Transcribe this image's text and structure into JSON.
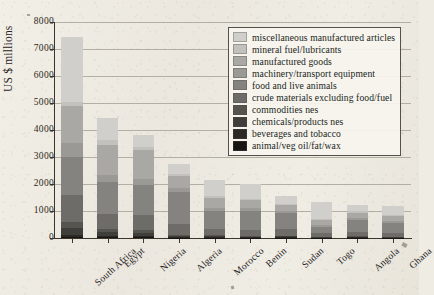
{
  "chart_data": {
    "type": "bar",
    "stacked": true,
    "title": "",
    "subtitle": "",
    "xlabel": "",
    "ylabel": "US $ millions",
    "ylim": [
      0,
      8000
    ],
    "ytick_values": [
      0,
      1000,
      2000,
      3000,
      4000,
      5000,
      6000,
      7000,
      8000
    ],
    "ytick_labels": [
      "0",
      "1000",
      "2000",
      "3000",
      "4000",
      "5000",
      "6000",
      "7000",
      "8000"
    ],
    "grid": true,
    "legend_position": "upper-right-inside",
    "categories": [
      "South Africa",
      "Egypt",
      "Nigeria",
      "Algeria",
      "Morocco",
      "Benin",
      "Sudan",
      "Togo",
      "Angola",
      "Ghana"
    ],
    "totals": [
      7430,
      4450,
      3800,
      2750,
      2150,
      2020,
      1550,
      1330,
      1240,
      1180
    ],
    "series": [
      {
        "name": "miscellaneous manufactured articles",
        "color": "#d0cfcb",
        "values": [
          2380,
          820,
          420,
          360,
          610,
          560,
          280,
          620,
          250,
          320
        ]
      },
      {
        "name": "mineral fuel/lubricants",
        "color": "#c2c1bd",
        "values": [
          140,
          180,
          130,
          90,
          70,
          60,
          50,
          40,
          60,
          40
        ]
      },
      {
        "name": "manufactured goods",
        "color": "#a9a8a4",
        "values": [
          1380,
          1130,
          1060,
          440,
          360,
          300,
          230,
          180,
          200,
          190
        ]
      },
      {
        "name": "machinery/transport equipment",
        "color": "#9a9995",
        "values": [
          520,
          260,
          210,
          150,
          120,
          110,
          80,
          70,
          70,
          60
        ]
      },
      {
        "name": "food and live animals",
        "color": "#84837f",
        "values": [
          1420,
          1170,
          1130,
          1180,
          640,
          700,
          560,
          250,
          440,
          400
        ]
      },
      {
        "name": "crude materials excluding food/fuel",
        "color": "#6d6c68",
        "values": [
          980,
          540,
          560,
          400,
          250,
          200,
          260,
          120,
          140,
          120
        ]
      },
      {
        "name": "commodities nes",
        "color": "#55544f",
        "values": [
          240,
          130,
          120,
          60,
          40,
          40,
          30,
          20,
          30,
          20
        ]
      },
      {
        "name": "chemicals/products nes",
        "color": "#3f3e3a",
        "values": [
          240,
          130,
          110,
          50,
          40,
          30,
          30,
          20,
          30,
          20
        ]
      },
      {
        "name": "beverages and tobacco",
        "color": "#2a2926",
        "values": [
          90,
          50,
          40,
          10,
          10,
          10,
          20,
          5,
          10,
          5
        ]
      },
      {
        "name": "animal/veg oil/fat/wax",
        "color": "#171614",
        "values": [
          40,
          40,
          20,
          10,
          10,
          10,
          10,
          5,
          10,
          5
        ]
      }
    ]
  },
  "legend": {
    "items": [
      "miscellaneous manufactured articles",
      "mineral fuel/lubricants",
      "manufactured goods",
      "machinery/transport equipment",
      "food and live animals",
      "crude materials excluding food/fuel",
      "commodities nes",
      "chemicals/products nes",
      "beverages and tobacco",
      "animal/veg oil/fat/wax"
    ]
  }
}
